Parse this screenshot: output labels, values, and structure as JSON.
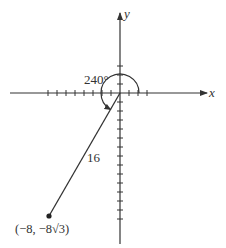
{
  "diagram": {
    "type": "angle-in-standard-position",
    "axes": {
      "x_label": "x",
      "y_label": "y"
    },
    "angle_label": "240°",
    "angle_degrees": 240,
    "segment_length_label": "16",
    "point_label": "(−8, −8√3)",
    "point": {
      "x": -8,
      "y": "-8√3"
    },
    "colors": {
      "ink": "#333333",
      "background": "#ffffff"
    }
  }
}
